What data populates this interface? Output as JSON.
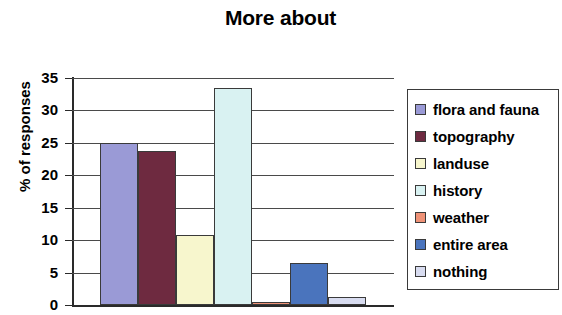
{
  "chart_data": {
    "type": "bar",
    "title": "More about",
    "xlabel": "",
    "ylabel": "% of responses",
    "ylim": [
      0,
      35
    ],
    "ytick_step": 5,
    "yticks": [
      35,
      30,
      25,
      20,
      15,
      10,
      5,
      0
    ],
    "grid": true,
    "legend_position": "right",
    "categories": [
      "flora and fauna",
      "topography",
      "landuse",
      "history",
      "weather",
      "entire area",
      "nothing"
    ],
    "values": [
      25.0,
      23.7,
      10.8,
      33.5,
      0.5,
      6.5,
      1.2
    ],
    "colors": [
      "#9a9ad6",
      "#6e2a40",
      "#f7f6cd",
      "#d9f2f2",
      "#ef9277",
      "#4a74bd",
      "#d8dcf0"
    ],
    "series": [
      {
        "name": "More about",
        "values": [
          25.0,
          23.7,
          10.8,
          33.5,
          0.5,
          6.5,
          1.2
        ]
      }
    ]
  },
  "legend": {
    "items": [
      {
        "label": "flora and fauna",
        "color": "#9a9ad6"
      },
      {
        "label": "topography",
        "color": "#6e2a40"
      },
      {
        "label": "landuse",
        "color": "#f7f6cd"
      },
      {
        "label": "history",
        "color": "#d9f2f2"
      },
      {
        "label": "weather",
        "color": "#ef9277"
      },
      {
        "label": "entire area",
        "color": "#4a74bd"
      },
      {
        "label": "nothing",
        "color": "#d8dcf0"
      }
    ]
  }
}
